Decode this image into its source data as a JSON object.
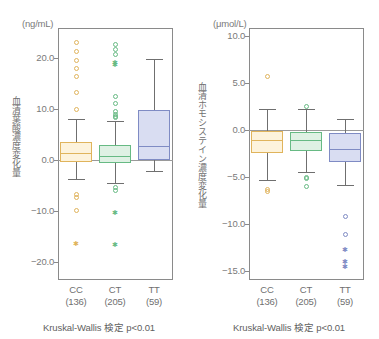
{
  "figure": {
    "panels": [
      {
        "id": "folate",
        "unit_label": "(ng/mL)",
        "y_axis_title": "血清葉酸濃度変化量",
        "caption": "Kruskal-Wallis 検定 p<0.01",
        "y_ticks": [
          "20.0",
          "10.0",
          "0.0",
          "−10.0",
          "−20.0"
        ],
        "categories": [
          {
            "name": "CC",
            "count": "(136)"
          },
          {
            "name": "CT",
            "count": "(205)"
          },
          {
            "name": "TT",
            "count": "(59)"
          }
        ]
      },
      {
        "id": "homocysteine",
        "unit_label": "(μmol/L)",
        "y_axis_title": "血清ホモシステイン濃度変化量",
        "caption": "Kruskal-Wallis 検定 p<0.01",
        "y_ticks": [
          "10.0",
          "5.0",
          "0.0",
          "−5.0",
          "−10.0",
          "−15.0"
        ],
        "categories": [
          {
            "name": "CC",
            "count": "(136)"
          },
          {
            "name": "CT",
            "count": "(205)"
          },
          {
            "name": "TT",
            "count": "(59)"
          }
        ]
      }
    ]
  },
  "colors": {
    "cc_fill": "#fdf3dc",
    "cc_stroke": "#e0b45c",
    "ct_fill": "#dff1e4",
    "ct_stroke": "#67ba84",
    "tt_fill": "#d9ddf2",
    "tt_stroke": "#7f8bc4",
    "axis": "#8a8a8a",
    "whisker": "#6f6f6f",
    "zero_line": "#9a9a9a",
    "text": "#6f6f6f"
  },
  "chart_data": [
    {
      "type": "box",
      "id": "folate",
      "title": "",
      "ylabel": "血清葉酸濃度変化量",
      "yunit": "(ng/mL)",
      "xlabel": "",
      "ylim": [
        -24.0,
        24.5
      ],
      "yticks": [
        20.0,
        10.0,
        0.0,
        -10.0,
        -20.0
      ],
      "grid": false,
      "legend": "none",
      "annotation": "Kruskal-Wallis 検定 p<0.01",
      "categories": [
        "CC (136)",
        "CT (205)",
        "TT (59)"
      ],
      "boxes": [
        {
          "name": "CC",
          "n": 136,
          "color": "#fdf3dc",
          "stroke": "#e0b45c",
          "whisker_low": -3.7,
          "q1": -0.4,
          "median": 1.3,
          "q3": 3.5,
          "whisker_high": 8.1,
          "outliers": [
            23.0,
            21.2,
            19.5,
            18.0,
            16.3,
            13.2,
            10.0,
            -6.7,
            -7.3,
            -9.9
          ],
          "far_outliers": [
            -16.3
          ]
        },
        {
          "name": "CT",
          "n": 205,
          "color": "#dff1e4",
          "stroke": "#67ba84",
          "whisker_low": -4.5,
          "q1": -0.6,
          "median": 0.8,
          "q3": 3.0,
          "whisker_high": 7.7,
          "outliers": [
            22.7,
            21.6,
            20.7,
            12.4,
            11.0,
            9.6,
            9.0,
            8.6,
            8.3,
            -5.3,
            -5.9
          ],
          "far_outliers": [
            19.2,
            18.7,
            -10.3,
            -16.5
          ]
        },
        {
          "name": "TT",
          "n": 59,
          "color": "#d9ddf2",
          "stroke": "#7f8bc4",
          "whisker_low": -2.2,
          "q1": 0.0,
          "median": 2.7,
          "q3": 9.8,
          "whisker_high": 19.9,
          "outliers": [],
          "far_outliers": []
        }
      ]
    },
    {
      "type": "box",
      "id": "homocysteine",
      "title": "",
      "ylabel": "血清ホモシステイン濃度変化量",
      "yunit": "(μmol/L)",
      "xlabel": "",
      "ylim": [
        -16.5,
        11.0
      ],
      "yticks": [
        10.0,
        5.0,
        0.0,
        -5.0,
        -10.0,
        -15.0
      ],
      "grid": false,
      "legend": "none",
      "annotation": "Kruskal-Wallis 検定 p<0.01",
      "categories": [
        "CC (136)",
        "CT (205)",
        "TT (59)"
      ],
      "boxes": [
        {
          "name": "CC",
          "n": 136,
          "color": "#fdf3dc",
          "stroke": "#e0b45c",
          "whisker_low": -5.3,
          "q1": -2.4,
          "median": -1.1,
          "q3": -0.1,
          "whisker_high": 2.2,
          "outliers": [
            5.7,
            -6.3,
            -6.5
          ],
          "far_outliers": []
        },
        {
          "name": "CT",
          "n": 205,
          "color": "#dff1e4",
          "stroke": "#67ba84",
          "whisker_low": -4.5,
          "q1": -2.2,
          "median": -1.1,
          "q3": -0.2,
          "whisker_high": 2.2,
          "outliers": [
            2.5,
            -5.0,
            -5.2,
            -6.0
          ],
          "far_outliers": []
        },
        {
          "name": "TT",
          "n": 59,
          "color": "#d9ddf2",
          "stroke": "#7f8bc4",
          "whisker_low": -5.8,
          "q1": -3.4,
          "median": -2.0,
          "q3": -0.3,
          "whisker_high": 1.2,
          "outliers": [
            -9.2,
            -11.1
          ],
          "far_outliers": [
            -12.7,
            -14.0,
            -14.5
          ]
        }
      ]
    }
  ]
}
